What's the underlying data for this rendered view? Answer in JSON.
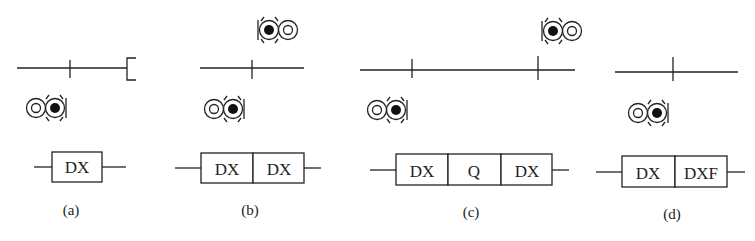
{
  "panels": [
    {
      "id": "a",
      "caption": "(a)",
      "track": {
        "x1": 17,
        "x2": 127,
        "y": 68,
        "joints": [
          70
        ],
        "end_bracket": true
      },
      "signals": [
        {
          "x": 26,
          "y": 108,
          "facing": "right"
        }
      ],
      "box": {
        "cells": [
          "DX"
        ]
      }
    },
    {
      "id": "b",
      "caption": "(b)",
      "track": {
        "x1": 200,
        "x2": 303,
        "y": 68,
        "joints": [
          252
        ]
      },
      "signals": [
        {
          "x": 258,
          "y": 30,
          "facing": "left"
        },
        {
          "x": 204,
          "y": 108,
          "facing": "right"
        }
      ],
      "box": {
        "cells": [
          "DX",
          "DX"
        ]
      }
    },
    {
      "id": "c",
      "caption": "(c)",
      "track": {
        "x1": 360,
        "x2": 575,
        "y": 70,
        "joints": [
          412,
          538
        ]
      },
      "signals": [
        {
          "x": 542,
          "y": 31,
          "facing": "left"
        },
        {
          "x": 367,
          "y": 110,
          "facing": "right"
        }
      ],
      "box": {
        "cells": [
          "DX",
          "Q",
          "DX"
        ]
      }
    },
    {
      "id": "d",
      "caption": "(d)",
      "track": {
        "x1": 615,
        "x2": 738,
        "y": 72,
        "joints": [
          673
        ]
      },
      "signals": [
        {
          "x": 628,
          "y": 113,
          "facing": "right"
        }
      ],
      "box": {
        "cells": [
          "DX",
          "DXF"
        ]
      }
    }
  ]
}
